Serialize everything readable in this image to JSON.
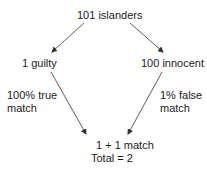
{
  "diagram": {
    "root": "101 islanders",
    "left_node": "1 guilty",
    "right_node": "100 innocent",
    "left_edge_label": [
      "100% true",
      "match"
    ],
    "right_edge_label": [
      "1% false",
      "match"
    ],
    "result_line1": "1 + 1 match",
    "result_line2": "Total = 2"
  },
  "colors": {
    "text": "#1a1a1a",
    "arrow": "#333333",
    "background": "#ffffff"
  }
}
